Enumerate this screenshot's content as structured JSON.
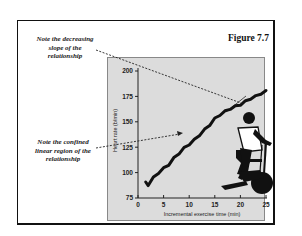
{
  "figure": {
    "title": "Figure 7.7",
    "annotations": [
      {
        "id": "decreasing-slope",
        "lines": [
          "Note the decreasing",
          "slope of the",
          "relationship"
        ]
      },
      {
        "id": "linear-region",
        "lines": [
          "Note the confined",
          "linear region of the",
          "relationship"
        ]
      }
    ],
    "illustration": "cyclist-on-stationary-bike"
  },
  "colors": {
    "panel_bg": "#dcdcdc",
    "trace": "#111111",
    "frame": "#111111"
  },
  "chart_data": {
    "type": "line",
    "title": "Figure 7.7",
    "xlabel": "Incremental exercise time (min)",
    "ylabel": "Heart rate (b/min)",
    "xlim": [
      0,
      25
    ],
    "ylim": [
      75,
      200
    ],
    "xticks": [
      0,
      5,
      10,
      15,
      20,
      25
    ],
    "yticks": [
      75,
      100,
      125,
      150,
      175,
      200
    ],
    "grid": false,
    "legend": null,
    "series": [
      {
        "name": "Heart rate",
        "x": [
          1.5,
          2,
          3,
          4,
          5,
          6,
          7,
          8,
          9,
          10,
          11,
          12,
          13,
          14,
          15,
          16,
          17,
          18,
          19,
          20,
          21,
          22,
          23,
          24,
          25
        ],
        "y": [
          90,
          88,
          95,
          100,
          104,
          108,
          114,
          119,
          124,
          128,
          132,
          137,
          142,
          147,
          153,
          157,
          160,
          163,
          165,
          167,
          170,
          173,
          175,
          178,
          180
        ]
      }
    ],
    "annotations": [
      {
        "text": "Note the decreasing slope of the relationship",
        "points_to": {
          "x": 20,
          "y": 167
        }
      },
      {
        "text": "Note the confined linear region of the relationship",
        "points_to": {
          "x": 11.5,
          "y": 137
        }
      }
    ]
  }
}
